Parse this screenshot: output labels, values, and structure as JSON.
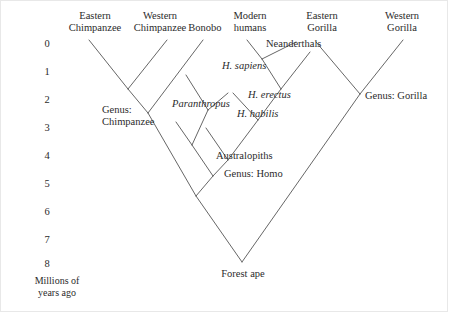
{
  "figure": {
    "type": "phylogenetic-tree",
    "axis": {
      "caption_line1": "Millions of",
      "caption_line2": "years ago",
      "ticks": [
        "0",
        "1",
        "2",
        "3",
        "4",
        "5",
        "6",
        "7",
        "8"
      ],
      "unit": "millions of years ago",
      "range": [
        0,
        8
      ]
    },
    "tip_labels": [
      {
        "id": "eastern-chimpanzee",
        "line1": "Eastern",
        "line2": "Chimpanzee"
      },
      {
        "id": "western-chimpanzee",
        "line1": "Western",
        "line2": "Chimpanzee"
      },
      {
        "id": "bonobo",
        "line1": "",
        "line2": "Bonobo"
      },
      {
        "id": "modern-humans",
        "line1": "Modern",
        "line2": "humans"
      },
      {
        "id": "eastern-gorilla",
        "line1": "Eastern",
        "line2": "Gorilla"
      },
      {
        "id": "western-gorilla",
        "line1": "Western",
        "line2": "Gorilla"
      }
    ],
    "internal_labels": [
      {
        "id": "neanderthals",
        "text": "Neanderthals",
        "italic": false
      },
      {
        "id": "h-sapiens",
        "text": "H. sapiens",
        "italic": true
      },
      {
        "id": "h-erectus",
        "text": "H. erectus",
        "italic": true
      },
      {
        "id": "h-habilis",
        "text": "H. habilis",
        "italic": true
      },
      {
        "id": "paranthropus",
        "text": "Paranthropus",
        "italic": true
      },
      {
        "id": "genus-chimpanzee-line1",
        "text": "Genus:",
        "italic": false
      },
      {
        "id": "genus-chimpanzee-line2",
        "text": "Chimpanzee",
        "italic": false
      },
      {
        "id": "genus-gorilla",
        "text": "Genus: Gorilla",
        "italic": false
      },
      {
        "id": "australopiths",
        "text": "Australopiths",
        "italic": false
      },
      {
        "id": "genus-homo-prefix",
        "text": "Genus: ",
        "italic": false
      },
      {
        "id": "genus-homo-name",
        "text": "Homo",
        "italic": true
      },
      {
        "id": "forest-ape",
        "text": "Forest ape",
        "italic": false
      }
    ],
    "colors": {
      "background": "#ffffff",
      "line": "#555555",
      "text": "#2b2b2b",
      "frame": "#e8e8e8"
    }
  }
}
